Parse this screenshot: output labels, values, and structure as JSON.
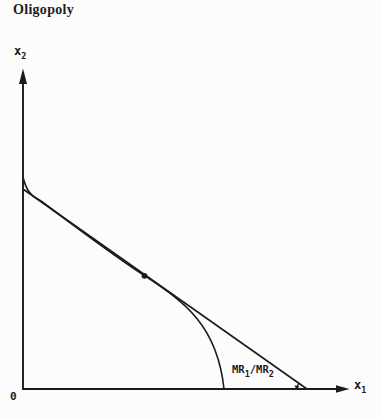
{
  "figure": {
    "title": "Oligopoly",
    "labels": {
      "y_axis_base": "x",
      "y_axis_sub": "2",
      "x_axis_base": "x",
      "x_axis_sub": "1",
      "origin": "0",
      "mr_part1": "MR",
      "mr_sub1": "1",
      "mr_slash": "/",
      "mr_part2": "MR",
      "mr_sub2": "2"
    },
    "colors": {
      "ink": "#1b1b1b",
      "background": "#fcfcfc"
    }
  }
}
